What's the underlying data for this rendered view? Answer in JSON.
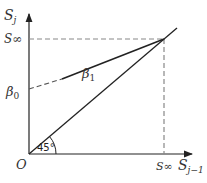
{
  "diagram": {
    "y_axis_label": "S",
    "y_axis_sub": "j",
    "x_axis_label": "S",
    "x_axis_sub": "j−1",
    "s_inf_y_label": "S∞",
    "s_inf_x_label": "S∞",
    "beta0_label": "β",
    "beta0_sub": "0",
    "beta1_label": "β",
    "beta1_sub": "1",
    "origin_label": "O",
    "angle_label": "45°",
    "colors": {
      "line": "#222222",
      "dashed": "#888888",
      "text": "#333333"
    }
  }
}
